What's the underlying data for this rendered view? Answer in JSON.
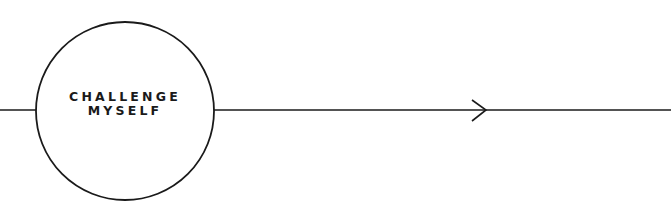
{
  "diagram": {
    "stroke_color": "#1a1a1a",
    "background": "#ffffff",
    "node": {
      "label_line1": "CHALLENGE",
      "label_line2": "MYSELF",
      "shape": "circle"
    },
    "connector_left": {
      "from": "left-edge",
      "to": "node"
    },
    "connector_right": {
      "from": "node",
      "to": "right-edge",
      "direction": "arrow-right"
    },
    "arrow_icon": "chevron-right-arrowhead"
  }
}
